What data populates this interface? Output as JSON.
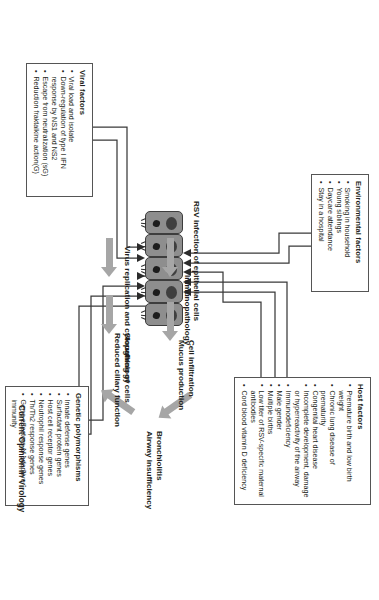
{
  "figure": {
    "credit": "Current Opinion in Virology"
  },
  "boxes": {
    "environmental": {
      "title": "Environmental factors",
      "items": [
        "Smoking in household",
        "Young siblings",
        "Daycare attendance",
        "Stay in a hospital"
      ]
    },
    "host": {
      "title": "Host factors",
      "items": [
        "Premature birth and low birth weight",
        "Chronic lung disease of prematurity",
        "Congenital heart disease",
        "Incomplete development, damage or hyperreactivity of the airway",
        "Immunodeficiency",
        "Male gender",
        "Multiple births",
        "Low titer of RSV-specific maternal antibodies",
        "Cord blood vitamin D deficiency"
      ]
    },
    "viral": {
      "title": "Viral factors",
      "items": [
        "Viral load and isolate",
        "Down-regulation of type I IFN response by NS1 and NS2",
        "Escape from neutralization (sG)",
        "Reduction fraktalkine action(G)"
      ]
    },
    "genetic": {
      "title": "Genetic polymorphisms",
      "items": [
        "Innate defense genes",
        "Surfactant protein genes",
        "Host cell receptor genes",
        "Neutrophil response genes",
        "Th/Th2 response genes",
        "Gene effectors of adaptive immunity"
      ]
    }
  },
  "flow": {
    "rsv_infection": "RSV infection of epithelial cells",
    "virus_replication": "Virus replication and cytopathology",
    "immunopathology": "Immunopathology",
    "cell_infiltration_line1": "Cell infiltration",
    "cell_infiltration_line2": "Mucus production",
    "sloughing_line1": "Sloughing of cells",
    "sloughing_line2": "Reduced ciliary function",
    "outcome_line1": "Bronchiolitis",
    "outcome_line2": "Airway insufficiency"
  },
  "icons": {
    "epithelial_cell": "epithelial-cell-icon",
    "nucleus": "nucleus-icon",
    "cilia": "cilia-icon"
  },
  "colors": {
    "cell_fill": "#8e8e8e",
    "cell_border": "#3d3d3d",
    "nucleus": "#3f3f3f",
    "process_arrow": "#a6a6a6",
    "connector": "#3a3a3a",
    "box_border": "#555555",
    "text": "#231f20"
  }
}
